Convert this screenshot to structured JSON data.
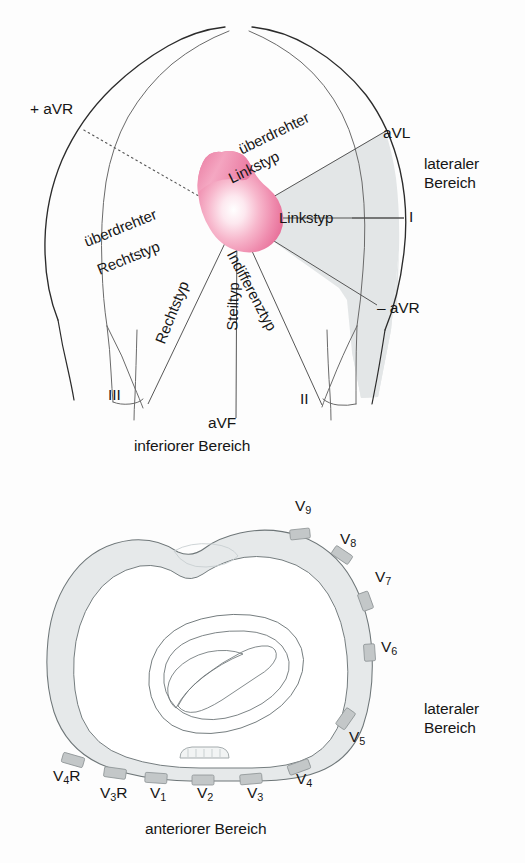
{
  "figure": {
    "background_color": "#fdfdfd",
    "line_color": "#2b2b2b",
    "thin_line_color": "#555555",
    "shade_color": "#e2e5e6",
    "electrode_color": "#c3c7c8",
    "heart_edge_color": "#e8729b",
    "heart_core_color": "#ffffff"
  },
  "top_panel": {
    "name": "frontal-plane-axis-diagram",
    "labels": {
      "plus_avr": "+ aVR",
      "minus_avr": "– aVR",
      "avl": "aVL",
      "lead_i": "I",
      "lead_ii": "II",
      "lead_iii": "III",
      "avf": "aVF",
      "lateral_region_line1": "lateraler",
      "lateral_region_line2": "Bereich",
      "inferior_region": "inferiorer Bereich"
    },
    "axis_types": [
      {
        "id": "ueberdrehter-linkstyp",
        "line1": "überdrehter",
        "line2": "Linkstyp",
        "rotation_deg": -26
      },
      {
        "id": "linkstyp",
        "line1": "Linkstyp",
        "line2": "",
        "rotation_deg": 0
      },
      {
        "id": "indifferenztyp",
        "line1": "Indifferenztyp",
        "line2": "",
        "rotation_deg": -62
      },
      {
        "id": "steiltyp",
        "line1": "Steiltyp",
        "line2": "",
        "rotation_deg": -88
      },
      {
        "id": "rechtstyp",
        "line1": "Rechtstyp",
        "line2": "",
        "rotation_deg": -68
      },
      {
        "id": "ueberdrehter-rechtstyp",
        "line1": "überdrehter",
        "line2": "Rechtstyp",
        "rotation_deg": -22
      }
    ]
  },
  "bottom_panel": {
    "name": "horizontal-plane-electrode-diagram",
    "labels": {
      "lateral_region_line1": "lateraler",
      "lateral_region_line2": "Bereich",
      "anterior_region": "anteriorer Bereich"
    },
    "electrodes": [
      {
        "id": "v9",
        "letter": "V",
        "index": "9",
        "suffix": ""
      },
      {
        "id": "v8",
        "letter": "V",
        "index": "8",
        "suffix": ""
      },
      {
        "id": "v7",
        "letter": "V",
        "index": "7",
        "suffix": ""
      },
      {
        "id": "v6",
        "letter": "V",
        "index": "6",
        "suffix": ""
      },
      {
        "id": "v5",
        "letter": "V",
        "index": "5",
        "suffix": ""
      },
      {
        "id": "v4",
        "letter": "V",
        "index": "4",
        "suffix": ""
      },
      {
        "id": "v3",
        "letter": "V",
        "index": "3",
        "suffix": ""
      },
      {
        "id": "v2",
        "letter": "V",
        "index": "2",
        "suffix": ""
      },
      {
        "id": "v1",
        "letter": "V",
        "index": "1",
        "suffix": ""
      },
      {
        "id": "v3r",
        "letter": "V",
        "index": "3",
        "suffix": "R"
      },
      {
        "id": "v4r",
        "letter": "V",
        "index": "4",
        "suffix": "R"
      }
    ]
  },
  "page_footer": {
    "partial_text": ""
  }
}
